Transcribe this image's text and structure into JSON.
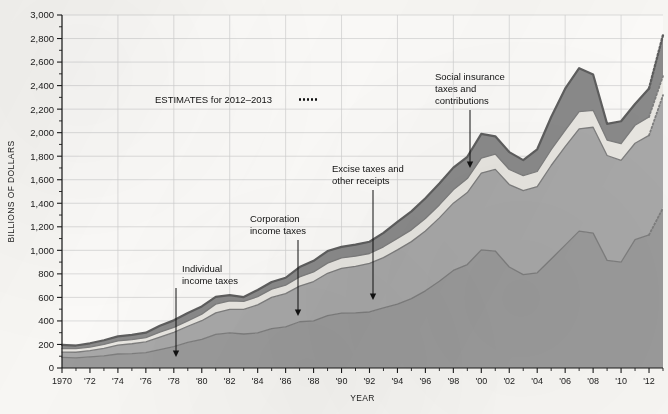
{
  "chart_data": {
    "type": "area",
    "title": "",
    "xlabel": "YEAR",
    "ylabel": "BILLIONS OF DOLLARS",
    "ylim": [
      0,
      3000
    ],
    "ytick_values": [
      0,
      200,
      400,
      600,
      800,
      1000,
      1200,
      1400,
      1600,
      1800,
      2000,
      2200,
      2400,
      2600,
      2800,
      3000
    ],
    "ytick_labels": [
      "0",
      "200",
      "400",
      "600",
      "800",
      "1,000",
      "1,200",
      "1,400",
      "1,600",
      "1,800",
      "2,000",
      "2,200",
      "2,400",
      "2,600",
      "2,800",
      "3,000"
    ],
    "xlim": [
      1970,
      2013
    ],
    "xtick_values": [
      1970,
      1972,
      1974,
      1976,
      1978,
      1980,
      1982,
      1984,
      1986,
      1988,
      1990,
      1992,
      1994,
      1996,
      1998,
      2000,
      2002,
      2004,
      2006,
      2008,
      2010,
      2012
    ],
    "xtick_labels": [
      "1970",
      "'72",
      "'74",
      "'76",
      "'78",
      "'80",
      "'82",
      "'84",
      "'86",
      "'88",
      "'90",
      "'92",
      "'94",
      "'96",
      "'98",
      "'00",
      "'02",
      "'04",
      "'06",
      "'08",
      "'10",
      "'12"
    ],
    "minor_xticks_every": 1,
    "grid": true,
    "grid_axis": "both",
    "legend": "inline-annotations",
    "stacked": true,
    "estimate_start_year": 2012,
    "estimate_style": "dotted",
    "x": [
      1970,
      1971,
      1972,
      1973,
      1974,
      1975,
      1976,
      1977,
      1978,
      1979,
      1980,
      1981,
      1982,
      1983,
      1984,
      1985,
      1986,
      1987,
      1988,
      1989,
      1990,
      1991,
      1992,
      1993,
      1994,
      1995,
      1996,
      1997,
      1998,
      1999,
      2000,
      2001,
      2002,
      2003,
      2004,
      2005,
      2006,
      2007,
      2008,
      2009,
      2010,
      2011,
      2012,
      2013
    ],
    "series": [
      {
        "name": "Individual income taxes",
        "color": "#9a9a9a",
        "values": [
          90,
          86,
          94,
          103,
          119,
          122,
          131,
          157,
          181,
          217,
          244,
          286,
          298,
          289,
          298,
          335,
          349,
          393,
          401,
          446,
          467,
          468,
          476,
          510,
          543,
          590,
          656,
          737,
          829,
          879,
          1004,
          994,
          858,
          794,
          809,
          927,
          1044,
          1163,
          1146,
          915,
          899,
          1091,
          1132,
          1360
        ]
      },
      {
        "name": "Social insurance taxes and contributions",
        "color": "#a8a8a8",
        "values": [
          45,
          48,
          53,
          64,
          76,
          84,
          91,
          106,
          121,
          138,
          158,
          183,
          201,
          209,
          239,
          265,
          283,
          303,
          334,
          359,
          380,
          396,
          414,
          428,
          461,
          484,
          509,
          539,
          572,
          612,
          653,
          694,
          701,
          713,
          733,
          794,
          838,
          870,
          900,
          891,
          865,
          819,
          845,
          959
        ]
      },
      {
        "name": "Excise taxes and other receipts",
        "color": "#e8e6e1",
        "values": [
          29,
          30,
          31,
          33,
          35,
          35,
          36,
          41,
          43,
          46,
          56,
          74,
          71,
          68,
          69,
          70,
          72,
          78,
          81,
          86,
          88,
          86,
          83,
          92,
          98,
          100,
          106,
          110,
          113,
          119,
          126,
          130,
          128,
          128,
          128,
          134,
          138,
          145,
          144,
          131,
          142,
          153,
          157,
          162
        ]
      },
      {
        "name": "Corporation income taxes",
        "color": "#8a8a8a",
        "values": [
          33,
          27,
          32,
          36,
          39,
          41,
          42,
          55,
          60,
          66,
          65,
          61,
          49,
          37,
          57,
          61,
          63,
          84,
          95,
          103,
          94,
          98,
          100,
          118,
          140,
          157,
          172,
          182,
          189,
          185,
          207,
          151,
          148,
          132,
          189,
          278,
          354,
          370,
          304,
          138,
          191,
          181,
          242,
          348
        ]
      }
    ],
    "annotations": [
      {
        "name": "individual-income-taxes",
        "label": "Individual\nincome taxes",
        "x": 182,
        "y": 272,
        "arrow_x": 176,
        "arrow_y1": 288,
        "arrow_y2": 357
      },
      {
        "name": "corporation-income-taxes",
        "label": "Corporation\nincome taxes",
        "x": 250,
        "y": 222,
        "arrow_x": 298,
        "arrow_y1": 240,
        "arrow_y2": 316
      },
      {
        "name": "excise-taxes",
        "label": "Excise taxes and\nother receipts",
        "x": 332,
        "y": 172,
        "arrow_x": 373,
        "arrow_y1": 190,
        "arrow_y2": 300
      },
      {
        "name": "social-insurance-taxes",
        "label": "Social insurance\ntaxes and\ncontributions",
        "x": 435,
        "y": 80,
        "arrow_x": 470,
        "arrow_y1": 110,
        "arrow_y2": 168
      }
    ],
    "estimates_note": "ESTIMATES for 2012–2013"
  },
  "colors": {
    "background": "#f7f6f3",
    "axis": "#1b1b1b",
    "grid": "#cfcfcf",
    "outline": "#636363",
    "individual": "#9a9a9a",
    "social_insurance": "#a8a8a8",
    "excise": "#e8e6e1",
    "corporation": "#8a8a8a"
  }
}
